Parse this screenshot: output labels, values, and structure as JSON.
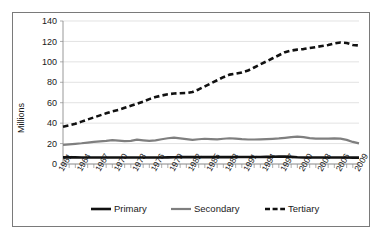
{
  "chart_data": {
    "type": "line",
    "title": "",
    "xlabel": "",
    "ylabel": "Millions",
    "ylim": [
      0,
      140
    ],
    "yticks": [
      0,
      20,
      40,
      60,
      80,
      100,
      120,
      140
    ],
    "ytick_labels": [
      "0",
      "20",
      "40",
      "60",
      "80",
      "100",
      "120",
      "140"
    ],
    "grid": true,
    "legend_position": "bottom",
    "x": [
      1961,
      1962,
      1963,
      1964,
      1965,
      1966,
      1967,
      1968,
      1969,
      1970,
      1971,
      1972,
      1973,
      1974,
      1975,
      1976,
      1977,
      1978,
      1979,
      1980,
      1981,
      1982,
      1983,
      1984,
      1985,
      1986,
      1987,
      1988,
      1989,
      1990,
      1991,
      1992,
      1993,
      1994,
      1995,
      1996,
      1997,
      1998,
      1999,
      2000,
      2001,
      2002,
      2003,
      2004,
      2005,
      2006,
      2007,
      2008,
      2009
    ],
    "xtick_labels": [
      "1961",
      "1964",
      "1967",
      "1970",
      "1973",
      "1976",
      "1979",
      "1982",
      "1985",
      "1988",
      "1991",
      "1994",
      "1997",
      "2000",
      "2003",
      "2006",
      "2009"
    ],
    "xtick_values": [
      1961,
      1964,
      1967,
      1970,
      1973,
      1976,
      1979,
      1982,
      1985,
      1988,
      1991,
      1994,
      1997,
      2000,
      2003,
      2006,
      2009
    ],
    "series": [
      {
        "name": "Primary",
        "color": "#111111",
        "style": "solid",
        "width": 2.6,
        "values": [
          6.5,
          6.5,
          6.5,
          6.4,
          6.4,
          6.4,
          6.4,
          6.4,
          6.4,
          6.4,
          6.3,
          6.3,
          6.3,
          6.3,
          6.3,
          6.4,
          6.4,
          6.5,
          6.6,
          6.7,
          6.7,
          6.7,
          6.7,
          6.7,
          6.7,
          6.7,
          6.7,
          6.7,
          6.8,
          6.8,
          6.8,
          6.9,
          6.9,
          7.0,
          7.1,
          7.2,
          7.3,
          7.0,
          6.6,
          6.4,
          6.3,
          6.3,
          6.3,
          6.3,
          6.3,
          6.3,
          6.3,
          6.2,
          6.2
        ]
      },
      {
        "name": "Secondary",
        "color": "#7f7f7f",
        "style": "solid",
        "width": 2.2,
        "values": [
          18.8,
          19.3,
          19.8,
          20.3,
          21.0,
          21.6,
          22.1,
          22.6,
          23.3,
          22.8,
          22.4,
          22.7,
          23.8,
          23.2,
          22.6,
          23.2,
          24.2,
          25.2,
          25.8,
          25.1,
          24.3,
          23.6,
          24.2,
          24.7,
          24.4,
          24.2,
          24.7,
          25.2,
          24.8,
          24.3,
          24.0,
          24.0,
          24.1,
          24.3,
          24.6,
          25.0,
          25.6,
          26.3,
          26.8,
          26.3,
          25.3,
          24.8,
          24.8,
          24.9,
          25.1,
          24.8,
          23.6,
          21.6,
          20.2
        ]
      },
      {
        "name": "Tertiary",
        "color": "#111111",
        "style": "dashed",
        "width": 2.6,
        "values": [
          36.5,
          37.8,
          39.4,
          41.5,
          43.6,
          45.6,
          47.6,
          49.6,
          51.6,
          53.0,
          55.0,
          57.0,
          59.0,
          61.0,
          63.5,
          65.5,
          67.0,
          68.3,
          69.0,
          69.3,
          69.5,
          70.5,
          73.0,
          76.0,
          79.0,
          82.0,
          85.0,
          87.5,
          88.5,
          89.5,
          91.5,
          94.5,
          97.5,
          100.5,
          103.5,
          106.5,
          109.5,
          111.0,
          112.0,
          112.5,
          113.5,
          114.5,
          115.5,
          116.5,
          118.0,
          119.0,
          118.5,
          116.5,
          116.0
        ]
      }
    ]
  },
  "legend": {
    "items": [
      {
        "label": "Primary"
      },
      {
        "label": "Secondary"
      },
      {
        "label": "Tertiary"
      }
    ]
  }
}
